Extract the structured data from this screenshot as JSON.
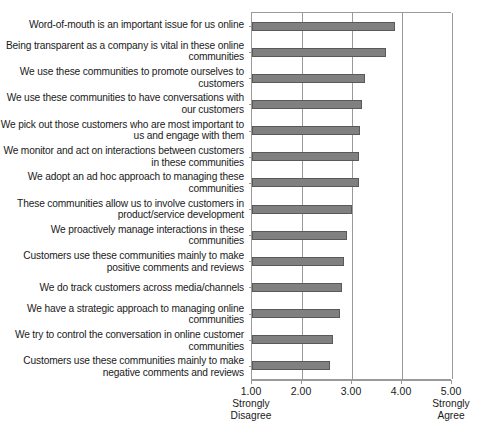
{
  "chart_data": {
    "type": "bar",
    "orientation": "horizontal",
    "title": "",
    "xlabel": "",
    "ylabel": "",
    "xlim": [
      1.0,
      5.0
    ],
    "grid": true,
    "legend": "none",
    "tick_labels": [
      "1.00",
      "2.00",
      "3.00",
      "4.00",
      "5.00"
    ],
    "ticks": [
      1.0,
      2.0,
      3.0,
      4.0,
      5.0
    ],
    "scale_anchor_low": "Strongly\nDisagree",
    "scale_anchor_high": "Strongly\nAgree",
    "bar_color": "#808080",
    "bar_edge_color": "#595959",
    "axis_color": "#9a9a9a",
    "categories": [
      "Word-of-mouth is an important issue for us online",
      "Being transparent as a company is vital in these online communities",
      "We use these communities to promote ourselves to customers",
      "We use these communities to have conversations with our customers",
      "We pick out those customers who are most important to us and engage with them",
      "We monitor and act on interactions between customers in these communities",
      "We adopt an ad hoc approach to managing these communities",
      "These communities allow us to involve customers in product/service development",
      "We proactively manage interactions in these communities",
      "Customers use these communities mainly to make positive comments and reviews",
      "We do track customers across media/channels",
      "We have a strategic approach to managing online communities",
      "We try to control the conversation in online customer communities",
      "Customers use these communities mainly to make negative comments and reviews"
    ],
    "values": [
      3.85,
      3.67,
      3.25,
      3.2,
      3.16,
      3.14,
      3.14,
      3.0,
      2.9,
      2.84,
      2.8,
      2.76,
      2.61,
      2.55
    ]
  },
  "axis": {
    "anchor_low_line1": "Strongly",
    "anchor_low_line2": "Disagree",
    "anchor_high_line1": "Strongly",
    "anchor_high_line2": "Agree"
  }
}
